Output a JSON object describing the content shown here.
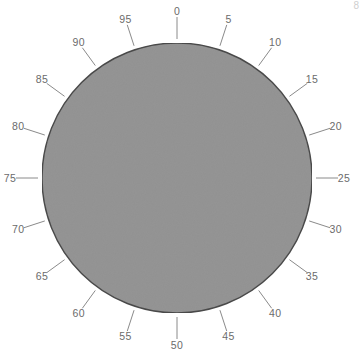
{
  "figure": {
    "type": "circular-dial",
    "background_color": "#ffffff",
    "corner_mark": "8"
  },
  "chart_data": {
    "type": "pie",
    "title": "",
    "subtitle": "",
    "xlabel": "",
    "ylabel": "",
    "grid": false,
    "legend": "none",
    "categories": [
      "0",
      "5",
      "10",
      "15",
      "20",
      "25",
      "30",
      "35",
      "40",
      "45",
      "50",
      "55",
      "60",
      "65",
      "70",
      "75",
      "80",
      "85",
      "90",
      "95"
    ],
    "values": [
      1,
      1,
      1,
      1,
      1,
      1,
      1,
      1,
      1,
      1,
      1,
      1,
      1,
      1,
      1,
      1,
      1,
      1,
      1,
      1
    ],
    "tick_count": 20,
    "tick_step": 5,
    "tick_range": [
      0,
      95
    ],
    "angle_step_degrees": 18,
    "start_angle_degrees": 0,
    "direction": "clockwise"
  },
  "dial": {
    "center_x": 177,
    "center_y": 178,
    "radius": 135,
    "fill_color": "#949494",
    "stroke_color": "#4a4a4a",
    "stroke_width": 1.4,
    "tick_color": "#8a8a8a",
    "tick_inner_offset": 4,
    "tick_length": 22,
    "label_color": "#6b6b6b",
    "label_radius": 167,
    "ticks": [
      {
        "label": "0",
        "angle": 0
      },
      {
        "label": "5",
        "angle": 18
      },
      {
        "label": "10",
        "angle": 36
      },
      {
        "label": "15",
        "angle": 54
      },
      {
        "label": "20",
        "angle": 72
      },
      {
        "label": "25",
        "angle": 90
      },
      {
        "label": "30",
        "angle": 108
      },
      {
        "label": "35",
        "angle": 126
      },
      {
        "label": "40",
        "angle": 144
      },
      {
        "label": "45",
        "angle": 162
      },
      {
        "label": "50",
        "angle": 180
      },
      {
        "label": "55",
        "angle": 198
      },
      {
        "label": "60",
        "angle": 216
      },
      {
        "label": "65",
        "angle": 234
      },
      {
        "label": "70",
        "angle": 252
      },
      {
        "label": "75",
        "angle": 270
      },
      {
        "label": "80",
        "angle": 288
      },
      {
        "label": "85",
        "angle": 306
      },
      {
        "label": "90",
        "angle": 324
      },
      {
        "label": "95",
        "angle": 342
      }
    ]
  }
}
